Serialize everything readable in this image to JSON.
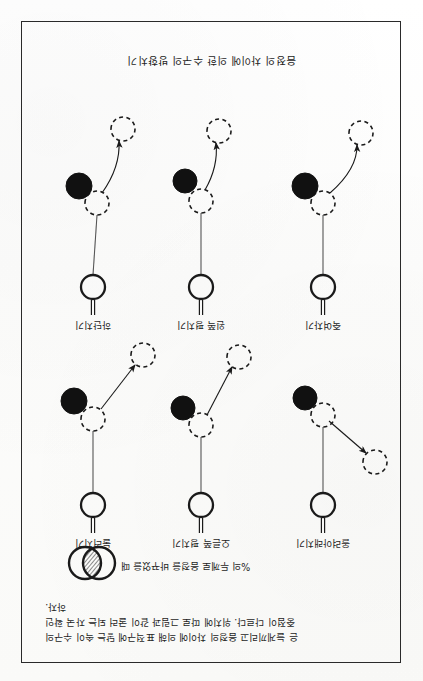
{
  "document": {
    "orientation": "upside-down-scan",
    "page_background": "#fdfdfc",
    "ink_color": "#1a1a1a"
  },
  "caption": "음정의 차이에 의한 수구의 방향치기",
  "note": {
    "lines": [
      "은 늘게끼리고 음정의 차이에 의해 표적구에 닿는 속이 수구의",
      "중점이 다르다. 위치에 따로 그림과 같이 굴러 되는 자국 확인",
      "하자."
    ]
  },
  "legend": {
    "text": "%의 두께로 음정을 바꾸었을 때",
    "glyph_name": "two-overlapping-circles-hatched-lens"
  },
  "diagrams": {
    "labels": [
      "올려아래치기",
      "오른쪽 평치기",
      "눌러치기",
      "죽여차기",
      "왼쪽 평치기",
      "하단치기"
    ],
    "elements": {
      "cue_ball": "solid-outline-circle",
      "cue_stick": "short-vertical-double-line",
      "contact_ball": "dashed-outline-circle",
      "object_ball": "filled-black-circle",
      "target_ball": "dashed-outline-circle",
      "path": "arrow-line"
    },
    "cells": [
      {
        "label_index": 0,
        "cue": {
          "cx": 64,
          "cy": 32,
          "r": 12
        },
        "stick": {
          "x": 64,
          "y1": 4,
          "y2": 19
        },
        "contact": {
          "cx": 64,
          "cy": 122,
          "r": 12
        },
        "object": {
          "cx": 82,
          "cy": 139,
          "r": 12
        },
        "target": {
          "cx": 12,
          "cy": 75,
          "r": 12
        },
        "arrow": {
          "x1": 58,
          "y1": 116,
          "x2": 21,
          "y2": 84,
          "curve": 0
        }
      },
      {
        "label_index": 1,
        "cue": {
          "cx": 64,
          "cy": 32,
          "r": 12
        },
        "stick": {
          "x": 64,
          "y1": 4,
          "y2": 19
        },
        "contact": {
          "cx": 64,
          "cy": 112,
          "r": 12
        },
        "object": {
          "cx": 82,
          "cy": 129,
          "r": 12
        },
        "target": {
          "cx": 26,
          "cy": 180,
          "r": 12
        },
        "arrow": {
          "x1": 58,
          "y1": 122,
          "x2": 33,
          "y2": 170,
          "curve": 0
        }
      },
      {
        "label_index": 2,
        "cue": {
          "cx": 64,
          "cy": 32,
          "r": 12
        },
        "stick": {
          "x": 64,
          "y1": 4,
          "y2": 19
        },
        "contact": {
          "cx": 64,
          "cy": 118,
          "r": 12
        },
        "object": {
          "cx": 83,
          "cy": 136,
          "r": 13
        },
        "target": {
          "cx": 14,
          "cy": 182,
          "r": 12
        },
        "arrow": {
          "x1": 56,
          "y1": 128,
          "x2": 22,
          "y2": 172,
          "curve": 0
        }
      },
      {
        "label_index": 3,
        "cue": {
          "cx": 64,
          "cy": 32,
          "r": 12
        },
        "stick": {
          "x": 64,
          "y1": 4,
          "y2": 19
        },
        "contact": {
          "cx": 64,
          "cy": 116,
          "r": 12
        },
        "object": {
          "cx": 82,
          "cy": 133,
          "r": 13
        },
        "target": {
          "cx": 26,
          "cy": 186,
          "r": 12
        },
        "arrow": {
          "x1": 57,
          "y1": 126,
          "x2": 30,
          "y2": 174,
          "curve": -14
        }
      },
      {
        "label_index": 4,
        "cue": {
          "cx": 64,
          "cy": 32,
          "r": 12
        },
        "stick": {
          "x": 64,
          "y1": 4,
          "y2": 19
        },
        "contact": {
          "cx": 64,
          "cy": 118,
          "r": 12
        },
        "object": {
          "cx": 80,
          "cy": 138,
          "r": 12
        },
        "target": {
          "cx": 46,
          "cy": 188,
          "r": 12
        },
        "arrow": {
          "x1": 60,
          "y1": 129,
          "x2": 49,
          "y2": 176,
          "curve": -8
        }
      },
      {
        "label_index": 5,
        "cue": {
          "cx": 64,
          "cy": 32,
          "r": 12
        },
        "stick": {
          "x": 64,
          "y1": 4,
          "y2": 19
        },
        "contact": {
          "cx": 60,
          "cy": 116,
          "r": 12
        },
        "object": {
          "cx": 78,
          "cy": 133,
          "r": 13
        },
        "target": {
          "cx": 34,
          "cy": 190,
          "r": 12
        },
        "arrow": {
          "x1": 55,
          "y1": 126,
          "x2": 38,
          "y2": 178,
          "curve": -10
        }
      }
    ]
  }
}
